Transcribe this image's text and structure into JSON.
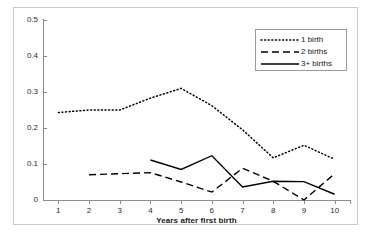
{
  "chart_data": {
    "type": "line",
    "title": "",
    "subtitle": "",
    "xlabel": "Years after first birth",
    "ylabel": "",
    "x": [
      1,
      2,
      3,
      4,
      5,
      6,
      7,
      8,
      9,
      10
    ],
    "xlim": [
      0.5,
      10.5
    ],
    "ylim": [
      0,
      0.5
    ],
    "ytick_labels": [
      "0",
      "0.1",
      "0.2",
      "0.3",
      "0.4",
      "0.5"
    ],
    "ytick_values": [
      0,
      0.1,
      0.2,
      0.3,
      0.4,
      0.5
    ],
    "xtick_labels": [
      "1",
      "2",
      "3",
      "4",
      "5",
      "6",
      "7",
      "8",
      "9",
      "10"
    ],
    "grid": false,
    "legend_position": "top-right",
    "series": [
      {
        "name": "1 birth",
        "style": "dotted",
        "color": "#000000",
        "x": [
          1,
          2,
          3,
          4,
          5,
          6,
          7,
          8,
          9,
          10
        ],
        "values": [
          0.243,
          0.25,
          0.25,
          0.283,
          0.31,
          0.262,
          0.195,
          0.117,
          0.152,
          0.113
        ]
      },
      {
        "name": "2 births",
        "style": "dashed",
        "color": "#000000",
        "x": [
          2,
          3,
          4,
          5,
          6,
          7,
          8,
          9,
          10
        ],
        "values": [
          0.07,
          0.073,
          0.076,
          0.05,
          0.022,
          0.088,
          0.052,
          0.0,
          0.073
        ]
      },
      {
        "name": "3+ births",
        "style": "solid",
        "color": "#000000",
        "x": [
          4,
          5,
          6,
          7,
          8,
          9,
          10
        ],
        "values": [
          0.111,
          0.085,
          0.123,
          0.036,
          0.052,
          0.051,
          0.016
        ]
      }
    ]
  },
  "legend": {
    "items": [
      {
        "label": "1 birth",
        "style": "dotted"
      },
      {
        "label": "2 births",
        "style": "dashed"
      },
      {
        "label": "3+ births",
        "style": "solid"
      }
    ]
  },
  "axis": {
    "x_title": "Years after first birth"
  },
  "colors": {
    "line": "#000000",
    "axis": "#8c8c8c",
    "frame": "#c9c9c9",
    "text": "#1a1a1a",
    "background": "#ffffff"
  }
}
